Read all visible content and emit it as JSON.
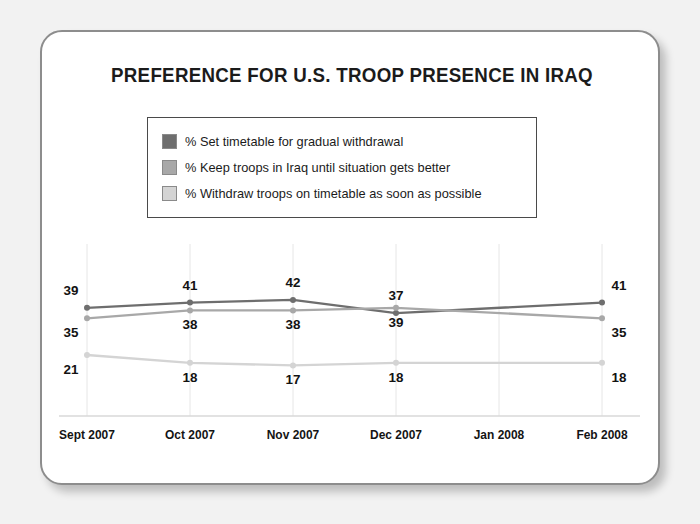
{
  "card": {
    "background_color": "#ffffff",
    "border_color": "#8d8d8d",
    "page_background": "#f2f2f2"
  },
  "chart_data": {
    "type": "line",
    "title": "PREFERENCE FOR U.S. TROOP PRESENCE IN IRAQ",
    "xlabel": "",
    "ylabel": "",
    "grid": true,
    "legend_position": "top-center",
    "categories": [
      "Sept 2007",
      "Oct 2007",
      "Nov 2007",
      "Dec 2007",
      "Jan 2008",
      "Feb 2008"
    ],
    "marker_categories": [
      "Sept 2007",
      "Oct 2007",
      "Nov 2007",
      "Dec 2007",
      "Feb 2008"
    ],
    "ylim": [
      0,
      50
    ],
    "series": [
      {
        "name": "% Set timetable for gradual withdrawal",
        "color": "#6e6e6e",
        "x": [
          "Sept 2007",
          "Oct 2007",
          "Nov 2007",
          "Dec 2007",
          "Feb 2008"
        ],
        "values": [
          39,
          41,
          42,
          37,
          41
        ],
        "label_position": "above"
      },
      {
        "name": "% Keep troops in Iraq until situation gets better",
        "color": "#a8a8a8",
        "x": [
          "Sept 2007",
          "Oct 2007",
          "Nov 2007",
          "Dec 2007",
          "Feb 2008"
        ],
        "values": [
          35,
          38,
          38,
          39,
          35
        ],
        "label_position": "below"
      },
      {
        "name": "% Withdraw troops on timetable as soon as possible",
        "color": "#d4d4d4",
        "x": [
          "Sept 2007",
          "Oct 2007",
          "Nov 2007",
          "Dec 2007",
          "Feb 2008"
        ],
        "values": [
          21,
          18,
          17,
          18,
          18
        ],
        "label_position": "below"
      }
    ]
  },
  "legend": [
    {
      "swatch_color": "#6e6e6e",
      "label": "% Set timetable for gradual withdrawal"
    },
    {
      "swatch_color": "#a8a8a8",
      "label": "% Keep troops in Iraq until situation gets better"
    },
    {
      "swatch_color": "#d4d4d4",
      "label": "% Withdraw troops on timetable as soon as possible"
    }
  ]
}
